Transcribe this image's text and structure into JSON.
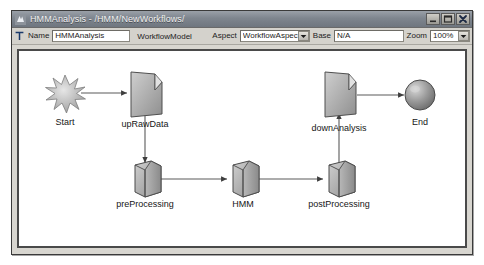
{
  "window": {
    "title": "HMMAnalysis - /HMM/NewWorkflows/",
    "app_icon": "workflow-app-icon",
    "minimize_label": "_",
    "maximize_label": "□",
    "close_label": "✕"
  },
  "property_bar": {
    "type_icon": "text-type-icon",
    "name_label": "Name",
    "name_value": "HMMAnalysis",
    "model_type": "WorkflowModel",
    "aspect_label": "Aspect",
    "aspect_value": "WorkflowAspec",
    "aspect_options": [
      "WorkflowAspec"
    ],
    "base_label": "Base",
    "base_value": "N/A",
    "zoom_label": "Zoom",
    "zoom_value": "100%",
    "zoom_options": [
      "100%"
    ]
  },
  "diagram": {
    "nodes": [
      {
        "id": "start",
        "label": "Start",
        "shape": "starburst",
        "x": 46,
        "y": 42,
        "label_x": 46,
        "label_y": 74
      },
      {
        "id": "upRawData",
        "label": "upRawData",
        "shape": "document",
        "x": 126,
        "y": 40,
        "label_x": 126,
        "label_y": 74
      },
      {
        "id": "downAnalysis",
        "label": "downAnalysis",
        "shape": "document",
        "x": 320,
        "y": 40,
        "label_x": 320,
        "label_y": 78
      },
      {
        "id": "end",
        "label": "End",
        "shape": "sphere",
        "x": 401,
        "y": 52,
        "label_x": 401,
        "label_y": 74
      },
      {
        "id": "preProcessing",
        "label": "preProcessing",
        "shape": "cylinder",
        "x": 126,
        "y": 126,
        "label_x": 126,
        "label_y": 152
      },
      {
        "id": "HMM",
        "label": "HMM",
        "shape": "cylinder",
        "x": 224,
        "y": 126,
        "label_x": 224,
        "label_y": 152
      },
      {
        "id": "postProcessing",
        "label": "postProcessing",
        "shape": "cylinder",
        "x": 320,
        "y": 126,
        "label_x": 320,
        "label_y": 152
      }
    ],
    "edges": [
      {
        "id": "start-to-upRawData",
        "from": "start",
        "to": "upRawData"
      },
      {
        "id": "upRawData-to-preProcessing",
        "from": "upRawData",
        "to": "preProcessing"
      },
      {
        "id": "preProcessing-to-HMM",
        "from": "preProcessing",
        "to": "HMM"
      },
      {
        "id": "HMM-to-postProcessing",
        "from": "HMM",
        "to": "postProcessing"
      },
      {
        "id": "postProcessing-to-downAnalysis",
        "from": "postProcessing",
        "to": "downAnalysis"
      },
      {
        "id": "downAnalysis-to-end",
        "from": "downAnalysis",
        "to": "end"
      }
    ]
  },
  "colors": {
    "titlebar": "#7e858e",
    "window_face": "#d8d6d0",
    "canvas": "#ffffff",
    "node_fill": "#a9a9a9",
    "node_stroke": "#4a4a4a",
    "edge": "#555555"
  }
}
